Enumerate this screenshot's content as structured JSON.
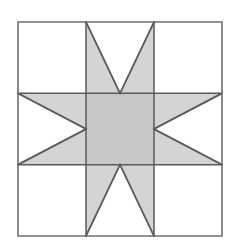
{
  "figure": {
    "title": "Eight-Pointed Star Quilt Block",
    "kind": "quilt-block-diagram"
  },
  "geometry": {
    "canvas_width": 240,
    "canvas_height": 242,
    "block_left": 18,
    "block_top": 22,
    "block_right": 222,
    "block_bottom": 236,
    "block_width": 204,
    "block_height": 214,
    "grid_divisions": 3,
    "grid_x": [
      18,
      86,
      154,
      222
    ],
    "grid_y": [
      22,
      93.33,
      164.67,
      236
    ]
  },
  "colors": {
    "background": "#ffffff",
    "patch_light": "#ffffff",
    "patch_star": "#d4d4d4",
    "patch_center": "#c8c8c8",
    "outline": "#5a5a5a",
    "outline_outer": "#6e6e6e"
  },
  "strokes": {
    "outer_border_width": 1.6,
    "grid_line_width": 1.5,
    "diagonal_line_width": 1.8
  },
  "patches": [
    {
      "id": "corner-top-left",
      "role": "corner",
      "fill": "patch_light",
      "row": 0,
      "col": 0
    },
    {
      "id": "star-point-top",
      "role": "star-point",
      "fill": "patch_star",
      "row": 0,
      "col": 1
    },
    {
      "id": "corner-top-right",
      "role": "corner",
      "fill": "patch_light",
      "row": 0,
      "col": 2
    },
    {
      "id": "star-point-left",
      "role": "star-point",
      "fill": "patch_star",
      "row": 1,
      "col": 0
    },
    {
      "id": "center-square",
      "role": "center",
      "fill": "patch_center",
      "row": 1,
      "col": 1
    },
    {
      "id": "star-point-right",
      "role": "star-point",
      "fill": "patch_star",
      "row": 1,
      "col": 2
    },
    {
      "id": "corner-bottom-left",
      "role": "corner",
      "fill": "patch_light",
      "row": 2,
      "col": 0
    },
    {
      "id": "star-point-bottom",
      "role": "star-point",
      "fill": "patch_star",
      "row": 2,
      "col": 1
    },
    {
      "id": "corner-bottom-right",
      "role": "corner",
      "fill": "patch_light",
      "row": 2,
      "col": 2
    }
  ],
  "shapes": {
    "star_body": "18,93.33 86,93.33 86,22 154,22 154,93.33 222,93.33 222,164.67 154,164.67 154,236 86,236 86,164.67 18,164.67",
    "white_notch_top": "86,22 154,22 120,93.33",
    "white_notch_bottom": "86,236 154,236 120,164.67",
    "white_notch_left": "18,93.33 18,164.67 86,129",
    "white_notch_right": "222,93.33 222,164.67 154,129",
    "center_square": "86,93.33 154,93.33 154,164.67 86,164.67",
    "diagonals": [
      "86,22 120,93.33",
      "154,22 120,93.33",
      "86,236 120,164.67",
      "154,236 120,164.67",
      "18,93.33 86,129",
      "18,164.67 86,129",
      "222,93.33 154,129",
      "222,164.67 154,129"
    ],
    "grid_lines": [
      "86,22 86,236",
      "154,22 154,236",
      "18,93.33 222,93.33",
      "18,164.67 222,164.67"
    ],
    "outer_border": "18,22 222,22 222,236 18,236"
  }
}
